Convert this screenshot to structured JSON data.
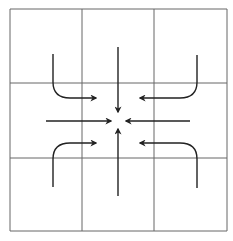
{
  "diagram": {
    "grid": {
      "rows": 3,
      "cols": 3,
      "x_lines": [
        10,
        82,
        154,
        227
      ],
      "y_lines": [
        9,
        83,
        158,
        231
      ],
      "line_color": "#666666"
    },
    "center": [
      118,
      120
    ],
    "arrow_color": "#222222",
    "arrows": [
      {
        "name": "arrow-from-top",
        "d": "M118 47 L118 112",
        "direction": "down"
      },
      {
        "name": "arrow-from-bottom",
        "d": "M118 196 L118 129",
        "direction": "up"
      },
      {
        "name": "arrow-from-left",
        "d": "M46 121 L111 121",
        "direction": "right"
      },
      {
        "name": "arrow-from-right",
        "d": "M190 121 L126 121",
        "direction": "left"
      },
      {
        "name": "curved-arrow-top-left",
        "d": "M53 54 L53 82 Q53 98 70 98 L96 98",
        "direction": "right"
      },
      {
        "name": "curved-arrow-top-right",
        "d": "M197 55 L197 82 Q197 98 180 98 L140 98",
        "direction": "left"
      },
      {
        "name": "curved-arrow-bottom-left",
        "d": "M53 187 L53 159 Q53 143 70 143 L96 143",
        "direction": "right"
      },
      {
        "name": "curved-arrow-bottom-right",
        "d": "M197 188 L197 159 Q197 143 180 143 L140 143",
        "direction": "left"
      }
    ]
  }
}
